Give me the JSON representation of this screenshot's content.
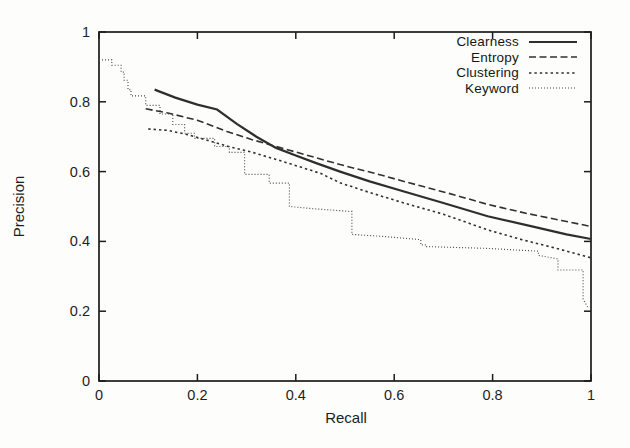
{
  "figure": {
    "background": "#fdfdfb",
    "axis_color": "#1c1c1c",
    "x_tick_labels": [
      "0",
      "0.2",
      "0.4",
      "0.6",
      "0.8",
      "1"
    ],
    "y_tick_labels": [
      "0",
      "0.2",
      "0.4",
      "0.6",
      "0.8",
      "1"
    ]
  },
  "chart_data": {
    "type": "line",
    "title": "",
    "xlabel": "Recall",
    "ylabel": "Precision",
    "xlim": [
      0,
      1
    ],
    "ylim": [
      0,
      1
    ],
    "x_tick_values": [
      0,
      0.2,
      0.4,
      0.6,
      0.8,
      1
    ],
    "y_tick_values": [
      0,
      0.2,
      0.4,
      0.6,
      0.8,
      1
    ],
    "grid": false,
    "legend_position": "top-right-inside",
    "series": [
      {
        "name": "Clearness",
        "style": "solid",
        "color": "#2e2e2e",
        "points": [
          [
            0.113,
            0.835
          ],
          [
            0.155,
            0.812
          ],
          [
            0.2,
            0.792
          ],
          [
            0.24,
            0.778
          ],
          [
            0.28,
            0.737
          ],
          [
            0.32,
            0.7
          ],
          [
            0.36,
            0.668
          ],
          [
            0.4,
            0.646
          ],
          [
            0.44,
            0.625
          ],
          [
            0.49,
            0.6
          ],
          [
            0.55,
            0.572
          ],
          [
            0.62,
            0.543
          ],
          [
            0.7,
            0.51
          ],
          [
            0.79,
            0.472
          ],
          [
            0.88,
            0.443
          ],
          [
            0.95,
            0.42
          ],
          [
            1.0,
            0.407
          ]
        ]
      },
      {
        "name": "Entropy",
        "style": "dashed",
        "color": "#303030",
        "points": [
          [
            0.095,
            0.78
          ],
          [
            0.14,
            0.768
          ],
          [
            0.2,
            0.747
          ],
          [
            0.26,
            0.715
          ],
          [
            0.31,
            0.692
          ],
          [
            0.36,
            0.672
          ],
          [
            0.42,
            0.648
          ],
          [
            0.49,
            0.62
          ],
          [
            0.56,
            0.595
          ],
          [
            0.63,
            0.568
          ],
          [
            0.71,
            0.538
          ],
          [
            0.79,
            0.506
          ],
          [
            0.87,
            0.48
          ],
          [
            0.94,
            0.46
          ],
          [
            1.0,
            0.443
          ]
        ]
      },
      {
        "name": "Clustering",
        "style": "dotted",
        "color": "#303030",
        "points": [
          [
            0.1,
            0.722
          ],
          [
            0.14,
            0.718
          ],
          [
            0.18,
            0.706
          ],
          [
            0.22,
            0.69
          ],
          [
            0.26,
            0.673
          ],
          [
            0.31,
            0.656
          ],
          [
            0.36,
            0.635
          ],
          [
            0.41,
            0.613
          ],
          [
            0.45,
            0.595
          ],
          [
            0.49,
            0.568
          ],
          [
            0.55,
            0.54
          ],
          [
            0.62,
            0.51
          ],
          [
            0.7,
            0.478
          ],
          [
            0.79,
            0.433
          ],
          [
            0.86,
            0.405
          ],
          [
            0.93,
            0.38
          ],
          [
            1.0,
            0.353
          ]
        ]
      },
      {
        "name": "Keyword",
        "style": "fine-dotted",
        "color": "#4c4c4c",
        "points": [
          [
            0.0,
            0.92
          ],
          [
            0.026,
            0.92
          ],
          [
            0.026,
            0.905
          ],
          [
            0.045,
            0.905
          ],
          [
            0.045,
            0.885
          ],
          [
            0.051,
            0.885
          ],
          [
            0.051,
            0.862
          ],
          [
            0.059,
            0.862
          ],
          [
            0.059,
            0.835
          ],
          [
            0.065,
            0.835
          ],
          [
            0.065,
            0.817
          ],
          [
            0.095,
            0.817
          ],
          [
            0.095,
            0.79
          ],
          [
            0.124,
            0.79
          ],
          [
            0.124,
            0.765
          ],
          [
            0.15,
            0.765
          ],
          [
            0.15,
            0.735
          ],
          [
            0.174,
            0.735
          ],
          [
            0.174,
            0.71
          ],
          [
            0.194,
            0.71
          ],
          [
            0.194,
            0.695
          ],
          [
            0.235,
            0.695
          ],
          [
            0.235,
            0.672
          ],
          [
            0.265,
            0.672
          ],
          [
            0.265,
            0.655
          ],
          [
            0.296,
            0.655
          ],
          [
            0.296,
            0.592
          ],
          [
            0.346,
            0.592
          ],
          [
            0.346,
            0.567
          ],
          [
            0.387,
            0.567
          ],
          [
            0.387,
            0.5
          ],
          [
            0.44,
            0.493
          ],
          [
            0.51,
            0.486
          ],
          [
            0.514,
            0.486
          ],
          [
            0.514,
            0.42
          ],
          [
            0.58,
            0.414
          ],
          [
            0.654,
            0.405
          ],
          [
            0.654,
            0.39
          ],
          [
            0.666,
            0.39
          ],
          [
            0.666,
            0.385
          ],
          [
            0.79,
            0.38
          ],
          [
            0.893,
            0.372
          ],
          [
            0.893,
            0.36
          ],
          [
            0.933,
            0.35
          ],
          [
            0.933,
            0.318
          ],
          [
            0.984,
            0.318
          ],
          [
            0.984,
            0.235
          ],
          [
            0.994,
            0.21
          ]
        ]
      }
    ]
  }
}
